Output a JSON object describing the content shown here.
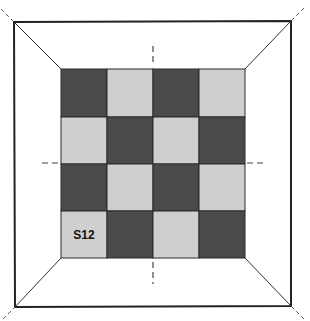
{
  "diagram": {
    "type": "room-floor-checkerboard",
    "grid": {
      "rows": 4,
      "cols": 4,
      "first_cell": "dark"
    },
    "colors": {
      "dark": "#4a4a4a",
      "light": "#cfcfcf",
      "line": "#222222",
      "background": "#ffffff"
    },
    "labels": [
      {
        "text": "S12",
        "row": 3,
        "col": 0
      }
    ]
  }
}
